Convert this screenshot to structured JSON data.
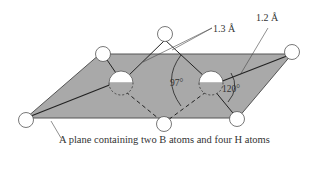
{
  "diagram": {
    "caption": "A plane containing two B atoms and four H atoms",
    "labels": {
      "bridge_bond_length": "1.3 Å",
      "terminal_bond_length": "1.2 Å",
      "bridge_angle": "97°",
      "terminal_angle": "120°"
    },
    "atoms": {
      "boron": [
        "B-left",
        "B-right"
      ],
      "hydrogen_terminal": [
        "H-top-left",
        "H-bottom-left",
        "H-top-right",
        "H-bottom-right"
      ],
      "hydrogen_bridging": [
        "H-bridge-top",
        "H-bridge-bottom"
      ]
    },
    "colors": {
      "plane_fill": "#a9a9a9",
      "plane_edge": "#555555",
      "atom_fill": "#ffffff",
      "bond": "#333333"
    }
  }
}
